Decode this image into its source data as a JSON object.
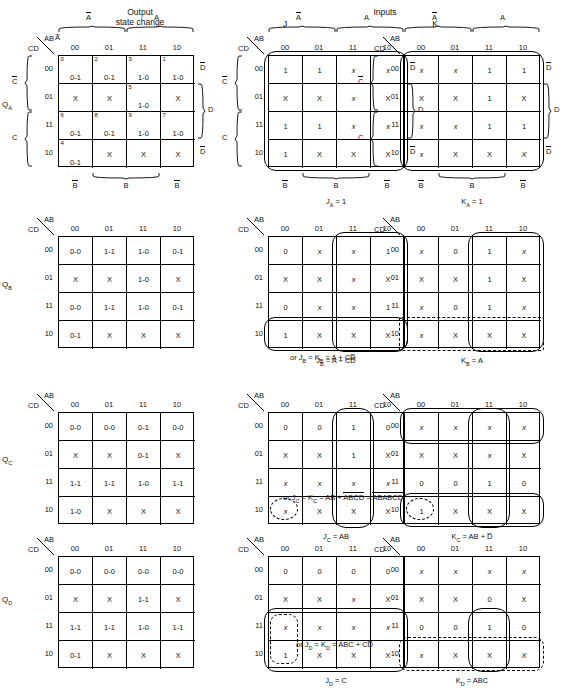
{
  "headers": {
    "output_state_change": "Output\nstate change",
    "output_line1": "Output",
    "output_line2": "state change",
    "inputs": "Inputs",
    "j": "J",
    "k": "K"
  },
  "axis": {
    "ab": "AB",
    "cd": "CD",
    "cols": [
      "00",
      "01",
      "11",
      "10"
    ],
    "rows": [
      "00",
      "01",
      "11",
      "10"
    ],
    "col_group_left": "A̅",
    "col_group_right": "A",
    "row_group_top": "C̅",
    "row_group_bottom": "C",
    "right_top": "D̅",
    "right_mid": "D",
    "right_bot": "D̅",
    "bottom_left": "B̅",
    "bottom_mid": "B",
    "bottom_right": "B̅"
  },
  "row_labels": {
    "qa": "Q",
    "qa_sub": "A",
    "qb": "Q",
    "qb_sub": "B",
    "qc": "Q",
    "qc_sub": "C",
    "qd": "Q",
    "qd_sub": "D"
  },
  "maps": {
    "qa_state": {
      "cells": [
        [
          {
            "mn": "0",
            "v": "0-1"
          },
          {
            "mn": "2",
            "v": "0-1"
          },
          {
            "mn": "3",
            "v": "1-0"
          },
          {
            "mn": "1",
            "v": "1-0"
          }
        ],
        [
          {
            "mn": "",
            "v": "X"
          },
          {
            "mn": "",
            "v": "X"
          },
          {
            "mn": "5",
            "v": "1-0"
          },
          {
            "mn": "",
            "v": "X"
          }
        ],
        [
          {
            "mn": "6",
            "v": "0-1"
          },
          {
            "mn": "8",
            "v": "0-1"
          },
          {
            "mn": "9",
            "v": "1-0"
          },
          {
            "mn": "7",
            "v": "1-0"
          }
        ],
        [
          {
            "mn": "4",
            "v": "0-1"
          },
          {
            "mn": "",
            "v": "X"
          },
          {
            "mn": "",
            "v": "X"
          },
          {
            "mn": "",
            "v": "X"
          }
        ]
      ]
    },
    "qa_j": {
      "cells": [
        [
          {
            "v": "1"
          },
          {
            "v": "1"
          },
          {
            "v": "x",
            "i": true
          },
          {
            "v": "x",
            "i": true
          }
        ],
        [
          {
            "v": "X"
          },
          {
            "v": "X"
          },
          {
            "v": "x",
            "i": true
          },
          {
            "v": "X"
          }
        ],
        [
          {
            "v": "1"
          },
          {
            "v": "1"
          },
          {
            "v": "x",
            "i": true
          },
          {
            "v": "x",
            "i": true
          }
        ],
        [
          {
            "v": "1"
          },
          {
            "v": "X"
          },
          {
            "v": "X"
          },
          {
            "v": "X"
          }
        ]
      ],
      "equation": "Jₐ = 1",
      "eq_main": "J",
      "eq_sub": "A",
      "eq_rest": " = 1"
    },
    "qa_k": {
      "cells": [
        [
          {
            "v": "x",
            "i": true
          },
          {
            "v": "x",
            "i": true
          },
          {
            "v": "1"
          },
          {
            "v": "1"
          }
        ],
        [
          {
            "v": "X"
          },
          {
            "v": "X"
          },
          {
            "v": "1"
          },
          {
            "v": "X"
          }
        ],
        [
          {
            "v": "x",
            "i": true
          },
          {
            "v": "x",
            "i": true
          },
          {
            "v": "1"
          },
          {
            "v": "1"
          }
        ],
        [
          {
            "v": "x",
            "i": true
          },
          {
            "v": "X"
          },
          {
            "v": "X"
          },
          {
            "v": "X",
            "i": true
          }
        ]
      ],
      "eq_main": "K",
      "eq_sub": "A",
      "eq_rest": " = 1"
    },
    "qb_state": {
      "cells": [
        [
          {
            "v": "0-0"
          },
          {
            "v": "1-1"
          },
          {
            "v": "1-0"
          },
          {
            "v": "0-1"
          }
        ],
        [
          {
            "v": "X"
          },
          {
            "v": "X"
          },
          {
            "v": "1-0"
          },
          {
            "v": "X"
          }
        ],
        [
          {
            "v": "0-0"
          },
          {
            "v": "1-1"
          },
          {
            "v": "1-0"
          },
          {
            "v": "0-1"
          }
        ],
        [
          {
            "v": "0-1"
          },
          {
            "v": "X"
          },
          {
            "v": "X"
          },
          {
            "v": "X"
          }
        ]
      ]
    },
    "qb_j": {
      "cells": [
        [
          {
            "v": "0"
          },
          {
            "v": "x",
            "i": true
          },
          {
            "v": "x",
            "i": true
          },
          {
            "v": "1"
          }
        ],
        [
          {
            "v": "X"
          },
          {
            "v": "X"
          },
          {
            "v": "x",
            "i": true
          },
          {
            "v": "X"
          }
        ],
        [
          {
            "v": "0"
          },
          {
            "v": "x",
            "i": true
          },
          {
            "v": "x",
            "i": true
          },
          {
            "v": "1"
          }
        ],
        [
          {
            "v": "1"
          },
          {
            "v": "X"
          },
          {
            "v": "X"
          },
          {
            "v": "X"
          }
        ]
      ],
      "eq_main": "J",
      "eq_sub": "B",
      "eq_rest": " = A + CD̅"
    },
    "qb_k": {
      "cells": [
        [
          {
            "v": "x",
            "i": true
          },
          {
            "v": "0"
          },
          {
            "v": "1"
          },
          {
            "v": "x",
            "i": true
          }
        ],
        [
          {
            "v": "X"
          },
          {
            "v": "X"
          },
          {
            "v": "1"
          },
          {
            "v": "X"
          }
        ],
        [
          {
            "v": "x",
            "i": true
          },
          {
            "v": "0"
          },
          {
            "v": "1"
          },
          {
            "v": "x",
            "i": true
          }
        ],
        [
          {
            "v": "x",
            "i": true
          },
          {
            "v": "X"
          },
          {
            "v": "X"
          },
          {
            "v": "X"
          }
        ]
      ],
      "eq_main": "K",
      "eq_sub": "B",
      "eq_rest": " = A"
    },
    "qb_or": {
      "prefix": "or J",
      "sub1": "B",
      "mid": " = K",
      "sub2": "B",
      "rest": " = A + CD̅"
    },
    "qc_state": {
      "cells": [
        [
          {
            "v": "0-0"
          },
          {
            "v": "0-0"
          },
          {
            "v": "0-1"
          },
          {
            "v": "0-0"
          }
        ],
        [
          {
            "v": "X"
          },
          {
            "v": "X"
          },
          {
            "v": "0-1"
          },
          {
            "v": "X"
          }
        ],
        [
          {
            "v": "1-1"
          },
          {
            "v": "1-1"
          },
          {
            "v": "1-0"
          },
          {
            "v": "1-1"
          }
        ],
        [
          {
            "v": "1-0"
          },
          {
            "v": "X"
          },
          {
            "v": "X"
          },
          {
            "v": "X"
          }
        ]
      ]
    },
    "qc_j": {
      "cells": [
        [
          {
            "v": "0"
          },
          {
            "v": "0"
          },
          {
            "v": "1"
          },
          {
            "v": "0"
          }
        ],
        [
          {
            "v": "X"
          },
          {
            "v": "X"
          },
          {
            "v": "1"
          },
          {
            "v": "X"
          }
        ],
        [
          {
            "v": "x",
            "i": true
          },
          {
            "v": "x",
            "i": true
          },
          {
            "v": "x",
            "i": true
          },
          {
            "v": "x",
            "i": true
          }
        ],
        [
          {
            "v": "x",
            "i": true
          },
          {
            "v": "X"
          },
          {
            "v": "X"
          },
          {
            "v": "X"
          }
        ]
      ],
      "eq_main": "J",
      "eq_sub": "C",
      "eq_rest": " = AB"
    },
    "qc_k": {
      "cells": [
        [
          {
            "v": "x",
            "i": true
          },
          {
            "v": "x",
            "i": true
          },
          {
            "v": "x",
            "i": true
          },
          {
            "v": "x",
            "i": true
          }
        ],
        [
          {
            "v": "X"
          },
          {
            "v": "X"
          },
          {
            "v": "x",
            "i": true
          },
          {
            "v": "X"
          }
        ],
        [
          {
            "v": "0"
          },
          {
            "v": "0"
          },
          {
            "v": "1"
          },
          {
            "v": "0"
          }
        ],
        [
          {
            "v": "1"
          },
          {
            "v": "X"
          },
          {
            "v": "X"
          },
          {
            "v": "X"
          }
        ]
      ],
      "eq_main": "K",
      "eq_sub": "C",
      "eq_rest": " = AB + D̅"
    },
    "qc_or": {
      "prefix": "or J",
      "sub1": "C",
      "mid": " = K",
      "sub2": "C",
      "rest": " = AB + ",
      "term1": "ABCD",
      "eqsign": " = ",
      "term2a": "AB",
      "term2b": "ABCD"
    },
    "qd_state": {
      "cells": [
        [
          {
            "v": "0-0"
          },
          {
            "v": "0-0"
          },
          {
            "v": "0-0"
          },
          {
            "v": "0-0"
          }
        ],
        [
          {
            "v": "X"
          },
          {
            "v": "X"
          },
          {
            "v": "1-1"
          },
          {
            "v": "X"
          }
        ],
        [
          {
            "v": "1-1"
          },
          {
            "v": "1-1"
          },
          {
            "v": "1-0"
          },
          {
            "v": "1-1"
          }
        ],
        [
          {
            "v": "0-1"
          },
          {
            "v": "X"
          },
          {
            "v": "X"
          },
          {
            "v": "X"
          }
        ]
      ]
    },
    "qd_j": {
      "cells": [
        [
          {
            "v": "0"
          },
          {
            "v": "0"
          },
          {
            "v": "0"
          },
          {
            "v": "0"
          }
        ],
        [
          {
            "v": "X"
          },
          {
            "v": "X"
          },
          {
            "v": "x",
            "i": true
          },
          {
            "v": "X"
          }
        ],
        [
          {
            "v": "x",
            "i": true
          },
          {
            "v": "x",
            "i": true
          },
          {
            "v": "x",
            "i": true
          },
          {
            "v": "x",
            "i": true
          }
        ],
        [
          {
            "v": "1"
          },
          {
            "v": "X"
          },
          {
            "v": "X"
          },
          {
            "v": "X"
          }
        ]
      ],
      "eq_main": "J",
      "eq_sub": "D",
      "eq_rest": " = C"
    },
    "qd_k": {
      "cells": [
        [
          {
            "v": "x",
            "i": true
          },
          {
            "v": "x",
            "i": true
          },
          {
            "v": "x",
            "i": true
          },
          {
            "v": "x",
            "i": true
          }
        ],
        [
          {
            "v": "X"
          },
          {
            "v": "X"
          },
          {
            "v": "0"
          },
          {
            "v": "X"
          }
        ],
        [
          {
            "v": "0"
          },
          {
            "v": "0"
          },
          {
            "v": "1"
          },
          {
            "v": "0"
          }
        ],
        [
          {
            "v": "x",
            "i": true
          },
          {
            "v": "X"
          },
          {
            "v": "X"
          },
          {
            "v": "X",
            "i": true
          }
        ]
      ],
      "eq_main": "K",
      "eq_sub": "D",
      "eq_rest": " = ABC"
    },
    "qd_or": {
      "prefix": "or J",
      "sub1": "D",
      "mid": " = K",
      "sub2": "D",
      "rest": " = ABC + CD̅"
    }
  }
}
